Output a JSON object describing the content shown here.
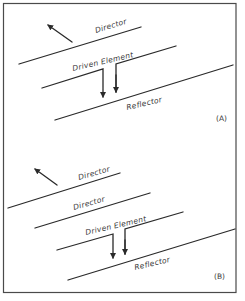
{
  "diagram": {
    "panels": [
      {
        "id": "A",
        "label": "(A)",
        "elements": [
          {
            "type": "director",
            "label": "Director"
          },
          {
            "type": "driven",
            "label": "Driven Element"
          },
          {
            "type": "reflector",
            "label": "Reflector"
          }
        ]
      },
      {
        "id": "B",
        "label": "(B)",
        "elements": [
          {
            "type": "director",
            "label": "Director"
          },
          {
            "type": "director",
            "label": "Director"
          },
          {
            "type": "driven",
            "label": "Driven Element"
          },
          {
            "type": "reflector",
            "label": "Reflector"
          }
        ]
      }
    ]
  }
}
